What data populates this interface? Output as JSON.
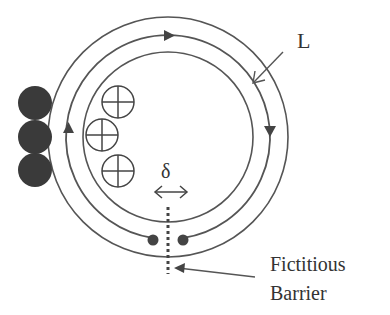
{
  "diagram": {
    "labels": {
      "L": "L",
      "delta": "δ",
      "barrier_line1": "Fictitious",
      "barrier_line2": "Barrier"
    },
    "colors": {
      "stroke": "#555555",
      "fill_dark": "#3a3a3a",
      "text": "#333333"
    },
    "elements": {
      "dark_circles": 3,
      "crossed_circles": 3,
      "concentric_rings": 3,
      "flow_arrows": 3
    }
  }
}
